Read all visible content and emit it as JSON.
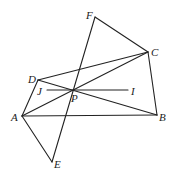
{
  "diagram": {
    "type": "geometry",
    "points": {
      "A": {
        "label": "A",
        "x": 22,
        "y": 116
      },
      "B": {
        "label": "B",
        "x": 157,
        "y": 115
      },
      "C": {
        "label": "C",
        "x": 148,
        "y": 52
      },
      "D": {
        "label": "D",
        "x": 38,
        "y": 80
      },
      "E": {
        "label": "E",
        "x": 52,
        "y": 162
      },
      "F": {
        "label": "F",
        "x": 95,
        "y": 17
      },
      "P": {
        "label": "P",
        "x": 73,
        "y": 90
      },
      "I": {
        "label": "I",
        "x": 128,
        "y": 90
      },
      "J": {
        "label": "J",
        "x": 47,
        "y": 90
      }
    },
    "segments": [
      [
        "A",
        "B"
      ],
      [
        "B",
        "C"
      ],
      [
        "C",
        "F"
      ],
      [
        "F",
        "E"
      ],
      [
        "E",
        "A"
      ],
      [
        "A",
        "D"
      ],
      [
        "D",
        "C"
      ],
      [
        "A",
        "C"
      ],
      [
        "D",
        "B"
      ],
      [
        "J",
        "I"
      ]
    ],
    "labels": {
      "A": "A",
      "B": "B",
      "C": "C",
      "D": "D",
      "E": "E",
      "F": "F",
      "P": "P",
      "I": "I",
      "J": "J"
    }
  }
}
